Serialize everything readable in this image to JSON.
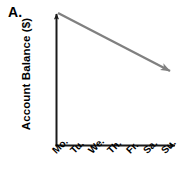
{
  "figure": {
    "part_label": "A.",
    "axis_color": "#1a1a1a",
    "series_color": "#808080",
    "background": "#ffffff"
  },
  "chart_data": {
    "type": "line",
    "title": "A.",
    "xlabel": "",
    "ylabel": "Account Balance ($)",
    "categories": [
      "Mo.",
      "Tu.",
      "We.",
      "Th.",
      "Fr.",
      "Sa.",
      "Su."
    ],
    "series": [
      {
        "name": "Account Balance",
        "values": [
          100,
          92,
          84,
          76,
          68,
          60,
          52
        ],
        "style": "straight-arrow",
        "trend": "decreasing",
        "color": "#808080",
        "arrowhead": "end"
      }
    ],
    "grid": false,
    "legend": false,
    "axis_ticks_shown": false,
    "y_axis_values_shown": false,
    "axis_arrows": [
      "y-top",
      "x-right"
    ],
    "xlim": [
      0,
      7
    ],
    "ylim": [
      0,
      100
    ]
  },
  "axes": {
    "y_title": "Account Balance ($)",
    "x_ticks": [
      {
        "label": "Mo.",
        "left": 50
      },
      {
        "label": "Tu.",
        "left": 68
      },
      {
        "label": "We.",
        "left": 86
      },
      {
        "label": "Th.",
        "left": 105
      },
      {
        "label": "Fr.",
        "left": 124
      },
      {
        "label": "Sa.",
        "left": 141
      },
      {
        "label": "Su.",
        "left": 159
      }
    ]
  }
}
